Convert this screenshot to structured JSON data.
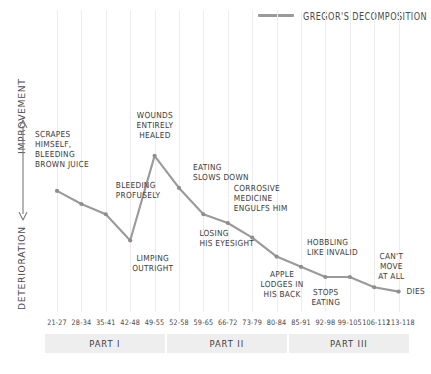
{
  "legend": {
    "label": "GREGOR'S DECOMPOSITION",
    "color": "#9a9a9a"
  },
  "axes": {
    "y_top_label": "IMPROVEMENT",
    "y_bottom_label": "DETERIORATION",
    "y_arrow_icon": "double-headed-vertical-arrow-icon"
  },
  "footnote": "",
  "parts": [
    {
      "label": "PART I",
      "start_index": 0,
      "end_index": 4
    },
    {
      "label": "PART II",
      "start_index": 5,
      "end_index": 9
    },
    {
      "label": "PART III",
      "start_index": 10,
      "end_index": 14
    }
  ],
  "chart_data": {
    "type": "line",
    "title": "",
    "subtitle": "",
    "xlabel": "",
    "ylabel": "DETERIORATION ↔ IMPROVEMENT",
    "grid": true,
    "legend_position": "top-right",
    "categories": [
      "21-27",
      "28-34",
      "35-41",
      "42-48",
      "49-55",
      "52-58",
      "59-65",
      "66-72",
      "73-79",
      "80-84",
      "85-91",
      "92-98",
      "99-105",
      "106-112",
      "113-118"
    ],
    "series": [
      {
        "name": "GREGOR'S DECOMPOSITION",
        "color": "#9a9a9a",
        "values": [
          72,
          63,
          56,
          38,
          96,
          74,
          56,
          50,
          40,
          27,
          20,
          13,
          13,
          6,
          3
        ]
      }
    ],
    "ylim": [
      0,
      100
    ],
    "annotations": [
      {
        "label": "SCRAPES\nHIMSELF,\nBLEEDING\nBROWN JUICE",
        "point_index": 0,
        "align": "left"
      },
      {
        "label": "BLEEDING\nPROFUSELY",
        "point_index": 2,
        "align": "left"
      },
      {
        "label": "LIMPING\nOUTRIGHT",
        "point_index": 3,
        "align": "center"
      },
      {
        "label": "WOUNDS\nENTIRELY\nHEALED",
        "point_index": 4,
        "align": "center"
      },
      {
        "label": "EATING\nSLOWS DOWN",
        "point_index": 5,
        "align": "left"
      },
      {
        "label": "LOSING\nHIS EYESIGHT",
        "point_index": 6,
        "align": "left"
      },
      {
        "label": "CORROSIVE\nMEDICINE\nENGULFS HIM",
        "point_index": 7,
        "align": "left"
      },
      {
        "label": "APPLE\nLODGES IN\nHIS BACK",
        "point_index": 9,
        "align": "center"
      },
      {
        "label": "HOBBLING\nLIKE INVALID",
        "point_index": 10,
        "align": "left"
      },
      {
        "label": "STOPS\nEATING",
        "point_index": 11,
        "align": "center"
      },
      {
        "label": "CAN'T\nMOVE\nAT ALL",
        "point_index": 13,
        "align": "center"
      },
      {
        "label": "DIES",
        "point_index": 14,
        "align": "left"
      }
    ]
  }
}
